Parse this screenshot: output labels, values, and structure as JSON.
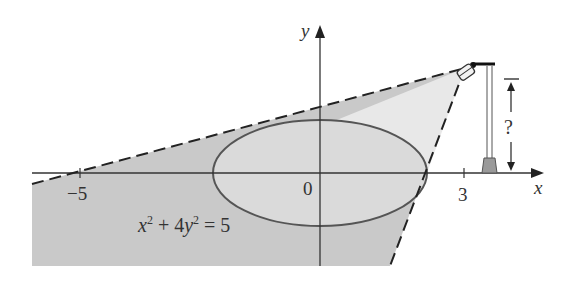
{
  "figure": {
    "equation": {
      "x_part": "x",
      "exp1": "2",
      "mid": " + 4",
      "y_part": "y",
      "exp2": "2",
      "rhs": " = 5"
    },
    "axis_labels": {
      "x": "x",
      "y": "y"
    },
    "tick_labels": {
      "neg5": "−5",
      "origin": "0",
      "three": "3"
    },
    "height_label": "?",
    "colors": {
      "shadow": "#c9c9c9",
      "lit_region": "#e6e6e6",
      "ellipse_fill": "#d9d9d9",
      "stroke": "#444444",
      "lamp_base": "#999999"
    }
  }
}
